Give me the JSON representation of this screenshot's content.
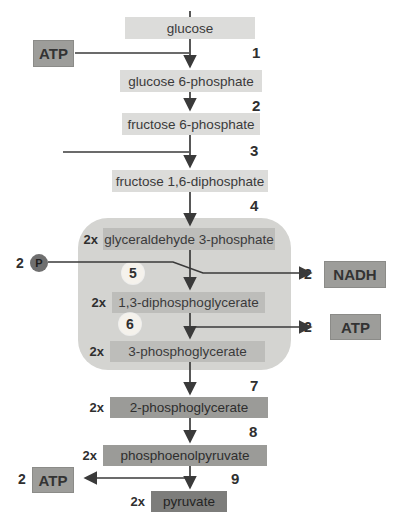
{
  "metabolites": [
    {
      "name": "glucose",
      "multiplier": ""
    },
    {
      "name": "glucose 6-phosphate",
      "multiplier": ""
    },
    {
      "name": "fructose 6-phosphate",
      "multiplier": ""
    },
    {
      "name": "fructose 1,6-diphosphate",
      "multiplier": ""
    },
    {
      "name": "glyceraldehyde 3-phosphate",
      "multiplier": "2x"
    },
    {
      "name": "1,3-diphosphoglycerate",
      "multiplier": "2x"
    },
    {
      "name": "3-phosphoglycerate",
      "multiplier": "2x"
    },
    {
      "name": "2-phosphoglycerate",
      "multiplier": "2x"
    },
    {
      "name": "phosphoenolpyruvate",
      "multiplier": "2x"
    },
    {
      "name": "pyruvate",
      "multiplier": "2x"
    }
  ],
  "steps": [
    "1",
    "2",
    "3",
    "4",
    "5",
    "6",
    "7",
    "8",
    "9"
  ],
  "cofactors": {
    "atp_in_top": {
      "label": "ATP"
    },
    "phosphate_in": {
      "quantity": "2",
      "label": "P"
    },
    "nadh_out": {
      "quantity": "2",
      "label": "NADH"
    },
    "atp_out_right": {
      "quantity": "2",
      "label": "ATP"
    },
    "atp_out_bottom": {
      "quantity": "2",
      "label": "ATP"
    }
  },
  "colors": {
    "light_box": "#dcdcda",
    "payoff_container": "#d4d4d1",
    "inner_box": "#bdbdba",
    "mid_box": "#9b9b98",
    "dark_box": "#7d7d7b",
    "cofactor_box": "#9d9d9a",
    "phosphate_circle": "#6f6f6f",
    "step_circle": "#f5f2ec",
    "arrow": "#3a3a3a"
  }
}
